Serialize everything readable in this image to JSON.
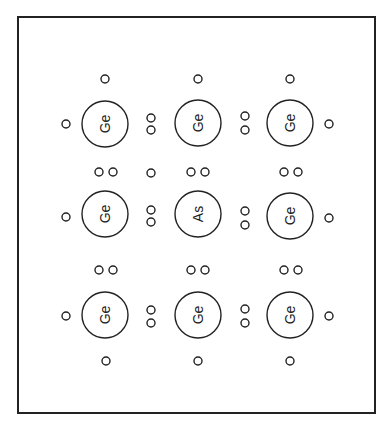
{
  "frame": {
    "x1": 18,
    "y1": 17,
    "x2": 375,
    "y2": 413,
    "stroke": "#222222"
  },
  "atoms": [
    {
      "label": "Ge",
      "cx": 105,
      "cy": 124
    },
    {
      "label": "Ge",
      "cx": 198,
      "cy": 123
    },
    {
      "label": "Ge",
      "cx": 290,
      "cy": 123
    },
    {
      "label": "Ge",
      "cx": 105,
      "cy": 214
    },
    {
      "label": "As",
      "cx": 198,
      "cy": 214
    },
    {
      "label": "Ge",
      "cx": 290,
      "cy": 216
    },
    {
      "label": "Ge",
      "cx": 105,
      "cy": 315
    },
    {
      "label": "Ge",
      "cx": 198,
      "cy": 315
    },
    {
      "label": "Ge",
      "cx": 290,
      "cy": 315
    }
  ],
  "atom_radius": 23,
  "electron_radius": 4,
  "electrons": [
    [
      105,
      79
    ],
    [
      198,
      79
    ],
    [
      290,
      79
    ],
    [
      66,
      124
    ],
    [
      151,
      118
    ],
    [
      151,
      130
    ],
    [
      245,
      116
    ],
    [
      245,
      130
    ],
    [
      329,
      124
    ],
    [
      99,
      172
    ],
    [
      113,
      172
    ],
    [
      151,
      173
    ],
    [
      191,
      172
    ],
    [
      205,
      172
    ],
    [
      284,
      172
    ],
    [
      298,
      172
    ],
    [
      66,
      217
    ],
    [
      151,
      210
    ],
    [
      151,
      222
    ],
    [
      245,
      211
    ],
    [
      245,
      225
    ],
    [
      329,
      218
    ],
    [
      99,
      270
    ],
    [
      113,
      270
    ],
    [
      191,
      270
    ],
    [
      205,
      270
    ],
    [
      284,
      270
    ],
    [
      298,
      270
    ],
    [
      66,
      316
    ],
    [
      151,
      310
    ],
    [
      151,
      323
    ],
    [
      245,
      309
    ],
    [
      245,
      323
    ],
    [
      329,
      316
    ],
    [
      106,
      361
    ],
    [
      198,
      361
    ],
    [
      290,
      361
    ]
  ]
}
